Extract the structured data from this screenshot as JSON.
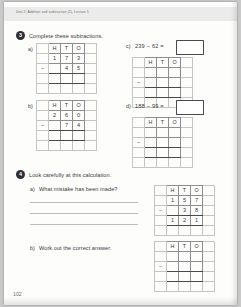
{
  "page": {
    "running_head": "Unit 2: Addition and subtraction (2), Lesson 5",
    "folio": "102"
  },
  "questions": [
    {
      "number": "3",
      "prompt": "Complete these subtractions.",
      "parts": [
        {
          "label": "a)",
          "type": "grid",
          "headers": [
            "H",
            "T",
            "O"
          ],
          "minuend": [
            "1",
            "7",
            "3"
          ],
          "operator": "−",
          "subtrahend": [
            "",
            "4",
            "5"
          ],
          "answer": [
            "",
            "",
            ""
          ]
        },
        {
          "label": "b)",
          "type": "grid",
          "headers": [
            "H",
            "T",
            "O"
          ],
          "minuend": [
            "2",
            "6",
            "0"
          ],
          "operator": "−",
          "subtrahend": [
            "",
            "7",
            "4"
          ],
          "answer": [
            "",
            "",
            ""
          ]
        },
        {
          "label": "c)",
          "type": "equation-grid",
          "equation": "239 − 62 =",
          "answer_value": "",
          "headers": [
            "H",
            "T",
            "O"
          ],
          "minuend": [
            "",
            "",
            ""
          ],
          "operator": "−",
          "subtrahend": [
            "",
            "",
            ""
          ],
          "answer": [
            "",
            "",
            ""
          ]
        },
        {
          "label": "d)",
          "type": "equation-grid",
          "equation": "188 − 99 =",
          "answer_value": "",
          "headers": [
            "H",
            "T",
            "O"
          ],
          "minuend": [
            "",
            "",
            ""
          ],
          "operator": "−",
          "subtrahend": [
            "",
            "",
            ""
          ],
          "answer": [
            "",
            "",
            ""
          ]
        }
      ]
    },
    {
      "number": "4",
      "prompt": "Look carefully at this calculation.",
      "parts": [
        {
          "label": "a)",
          "text": "What mistake has been made?",
          "type": "worked-grid",
          "headers": [
            "H",
            "T",
            "O"
          ],
          "minuend": [
            "1",
            "5",
            "7"
          ],
          "operator": "−",
          "subtrahend": [
            "",
            "3",
            "8"
          ],
          "answer": [
            "1",
            "2",
            "1"
          ]
        },
        {
          "label": "b)",
          "text": "Work out the correct answer.",
          "type": "grid",
          "headers": [
            "H",
            "T",
            "O"
          ],
          "minuend": [
            "",
            "",
            ""
          ],
          "operator": "−",
          "subtrahend": [
            "",
            "",
            ""
          ],
          "answer": [
            "",
            "",
            ""
          ]
        }
      ]
    }
  ]
}
